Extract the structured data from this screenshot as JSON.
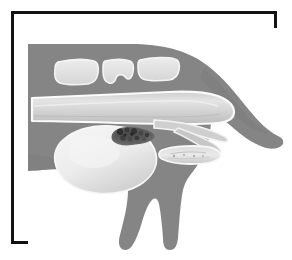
{
  "figure": {
    "caption": "",
    "domain_kind": "medical-illustration",
    "frame": {
      "border_color": "#121212",
      "border_width_px": 3,
      "background_color": "#ffffff"
    },
    "palette": {
      "background": "#ffffff",
      "body_gray": "#858585",
      "body_gray_shadow": "#7b7b7b",
      "organ_fill_light": "#e9e9e9",
      "organ_fill_mid": "#c9c9c9",
      "organ_outline": "#fbfbfb",
      "tooth_fill": "#e3e3e3",
      "tooth_outline": "#f4f4f4",
      "mass_dark": "#3a3a3a",
      "mass_mid": "#6a6a6a",
      "frame_black": "#121212"
    },
    "structures": [
      {
        "id": "body-silhouette",
        "label": "Dog head, neck and forelimb silhouette",
        "color": "#858585",
        "interactable": false
      },
      {
        "id": "teeth",
        "label": "Teeth",
        "count": 3,
        "color": "#e3e3e3",
        "interactable": false
      },
      {
        "id": "esophagus",
        "label": "Esophagus",
        "color": "#d8d8d8",
        "interactable": false
      },
      {
        "id": "stomach",
        "label": "Stomach",
        "color": "#e9e9e9",
        "interactable": false
      },
      {
        "id": "gastric-foreign-body",
        "label": "Dark mottled gastric mass / foreign body",
        "color": "#3a3a3a",
        "interactable": false
      },
      {
        "id": "duodenum",
        "label": "Duodenum segment",
        "color": "#d5d5d5",
        "interactable": false
      },
      {
        "id": "pylorus-duct",
        "label": "Pyloric outflow duct",
        "color": "#cfcfcf",
        "interactable": false
      }
    ]
  }
}
